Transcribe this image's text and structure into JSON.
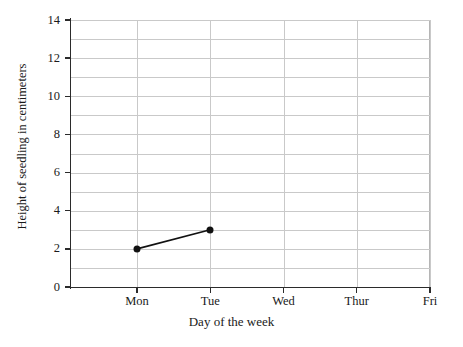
{
  "chart_data": {
    "type": "line",
    "title": "",
    "xlabel": "Day of the week",
    "ylabel": "Height of seedling in centimeters",
    "categories": [
      "Mon",
      "Tue",
      "Wed",
      "Thur",
      "Fri"
    ],
    "x_tick_labels": [
      "Mon",
      "Tue",
      "Wed",
      "Thur",
      "Fri"
    ],
    "y_tick_labels": [
      "0",
      "2",
      "4",
      "6",
      "8",
      "10",
      "12",
      "14"
    ],
    "y_tick_values": [
      0,
      2,
      4,
      6,
      8,
      10,
      12,
      14
    ],
    "ylim": [
      0,
      14
    ],
    "grid": "horizontal-and-vertical",
    "gridline_values_y": [
      0,
      1,
      2,
      3,
      4,
      5,
      6,
      7,
      8,
      9,
      10,
      11,
      12,
      13,
      14
    ],
    "legend": "none",
    "series": [
      {
        "name": "Height of seedling",
        "marker": "filled-circle",
        "color": "#111111",
        "points": [
          {
            "x": "Mon",
            "y": 2
          },
          {
            "x": "Tue",
            "y": 3
          }
        ],
        "values": [
          2,
          3,
          null,
          null,
          null
        ]
      }
    ],
    "colors": {
      "gridline": "#c9c9c9",
      "axis": "#2b2b2b",
      "data": "#111111",
      "background": "#ffffff",
      "text": "#1a1a1a"
    }
  }
}
